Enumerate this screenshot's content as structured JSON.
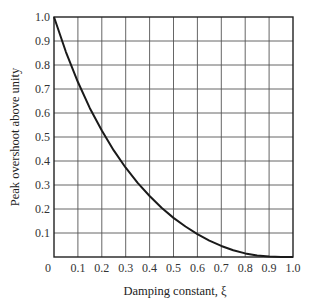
{
  "chart_data": {
    "type": "line",
    "title": "",
    "xlabel": "Damping constant, ξ",
    "ylabel": "Peak overshoot above unity",
    "xlim": [
      0,
      1.0
    ],
    "ylim": [
      0,
      1.0
    ],
    "grid": true,
    "legend": null,
    "x_ticks": [
      "0",
      "0.1",
      "0.2",
      "0.3",
      "0.4",
      "0.5",
      "0.6",
      "0.7",
      "0.8",
      "0.9",
      "1.0"
    ],
    "y_ticks": [
      "0.1",
      "0.2",
      "0.3",
      "0.4",
      "0.5",
      "0.6",
      "0.7",
      "0.8",
      "0.9",
      "1.0"
    ],
    "series": [
      {
        "name": "Peak overshoot",
        "x": [
          0.0,
          0.05,
          0.1,
          0.15,
          0.2,
          0.25,
          0.3,
          0.35,
          0.4,
          0.45,
          0.5,
          0.55,
          0.6,
          0.65,
          0.7,
          0.75,
          0.8,
          0.85,
          0.9,
          0.95,
          1.0
        ],
        "values": [
          1.0,
          0.854,
          0.729,
          0.62,
          0.527,
          0.444,
          0.372,
          0.309,
          0.254,
          0.205,
          0.163,
          0.127,
          0.095,
          0.068,
          0.046,
          0.028,
          0.015,
          0.006,
          0.002,
          0.0,
          0.0
        ]
      }
    ]
  },
  "colors": {
    "curve": "#1a1a1a",
    "grid": "#555555",
    "background": "#ffffff"
  }
}
